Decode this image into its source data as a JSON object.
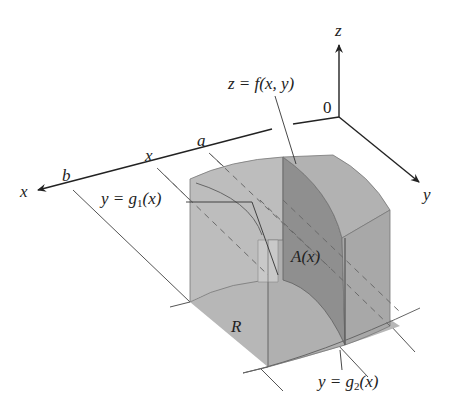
{
  "figure": {
    "type": "3d-solid-cross-section",
    "axes": {
      "x": "x",
      "y": "y",
      "z": "z",
      "origin": "0"
    },
    "labels": {
      "surface": "z = f(x, y)",
      "a": "a",
      "b": "b",
      "x_tick": "x",
      "g1_prefix": "y = g",
      "g1_sub": "1",
      "g1_suffix": "(x)",
      "g2_prefix": "y = g",
      "g2_sub": "2",
      "g2_suffix": "(x)",
      "area": "A(x)",
      "region": "R"
    },
    "colors": {
      "background": "#ffffff",
      "axis": "#222222",
      "solid_light": "#bdbdbd",
      "solid_mid": "#a9a9a9",
      "solid_dark": "#8f8f8f",
      "edge": "#6e6e6e",
      "base": "#b4b4b4"
    }
  }
}
